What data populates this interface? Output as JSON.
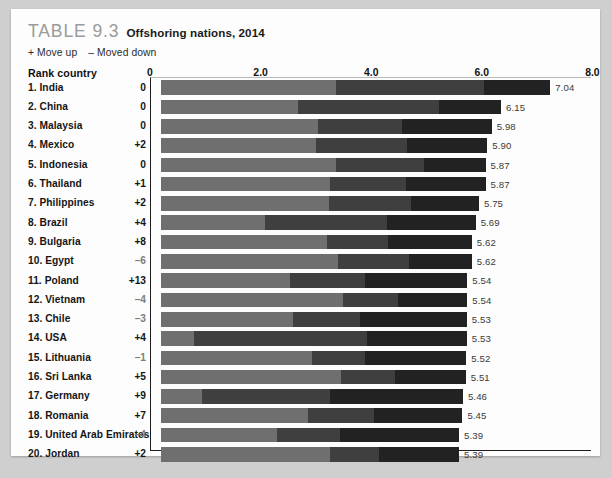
{
  "title": {
    "table_label": "TABLE 9.3",
    "caption": "Offshoring nations, 2014"
  },
  "legend": {
    "up": "+ Move up",
    "down": "– Moved down"
  },
  "headers": {
    "rank_country": "Rank country"
  },
  "colors": {
    "segment_1": "#6f6f6f",
    "segment_2": "#3f3f3f",
    "segment_3": "#222222",
    "card_background": "#fdfdfd",
    "page_background": "#cfcfcf",
    "table_label": "#9a9a9a",
    "move_down_text": "#7e7e7e"
  },
  "chart_data": {
    "type": "bar",
    "orientation": "horizontal",
    "stacked": true,
    "title": "Offshoring nations, 2014",
    "xlabel": "",
    "ylabel": "Rank country",
    "xlim": [
      0,
      8
    ],
    "xticks": [
      "0",
      "2.0",
      "4.0",
      "6.0",
      "8.0"
    ],
    "xtick_values": [
      0,
      2,
      4,
      6,
      8
    ],
    "grid": false,
    "legend_position": "none",
    "series": [
      {
        "name": "Financial attractiveness",
        "color": "#6f6f6f"
      },
      {
        "name": "People skills and availability",
        "color": "#3f3f3f"
      },
      {
        "name": "Business environment",
        "color": "#222222"
      }
    ],
    "categories": [
      "1. India",
      "2. China",
      "3. Malaysia",
      "4. Mexico",
      "5. Indonesia",
      "6. Thailand",
      "7. Philippines",
      "8. Brazil",
      "9. Bulgaria",
      "10. Egypt",
      "11. Poland",
      "12. Vietnam",
      "13. Chile",
      "14. USA",
      "15. Lithuania",
      "16. Sri Lanka",
      "17. Germany",
      "18. Romania",
      "19. United Arab Emirates",
      "20. Jordan"
    ],
    "rows": [
      {
        "rank": 1,
        "country": "1. India",
        "move": "0",
        "move_dir": "none",
        "total": "7.04",
        "total_value": 7.04,
        "segments": [
          3.16,
          2.68,
          1.2
        ]
      },
      {
        "rank": 2,
        "country": "2. China",
        "move": "0",
        "move_dir": "none",
        "total": "6.15",
        "total_value": 6.15,
        "segments": [
          2.48,
          2.55,
          1.12
        ]
      },
      {
        "rank": 3,
        "country": "3. Malaysia",
        "move": "0",
        "move_dir": "none",
        "total": "5.98",
        "total_value": 5.98,
        "segments": [
          2.84,
          1.52,
          1.62
        ]
      },
      {
        "rank": 4,
        "country": "4. Mexico",
        "move": "+2",
        "move_dir": "up",
        "total": "5.90",
        "total_value": 5.9,
        "segments": [
          2.8,
          1.65,
          1.45
        ]
      },
      {
        "rank": 5,
        "country": "5. Indonesia",
        "move": "0",
        "move_dir": "none",
        "total": "5.87",
        "total_value": 5.87,
        "segments": [
          3.16,
          1.6,
          1.11
        ]
      },
      {
        "rank": 6,
        "country": "6. Thailand",
        "move": "+1",
        "move_dir": "up",
        "total": "5.87",
        "total_value": 5.87,
        "segments": [
          3.05,
          1.38,
          1.44
        ]
      },
      {
        "rank": 7,
        "country": "7. Philippines",
        "move": "+2",
        "move_dir": "up",
        "total": "5.75",
        "total_value": 5.75,
        "segments": [
          3.04,
          1.48,
          1.23
        ]
      },
      {
        "rank": 8,
        "country": "8. Brazil",
        "move": "+4",
        "move_dir": "up",
        "total": "5.69",
        "total_value": 5.69,
        "segments": [
          1.88,
          2.2,
          1.61
        ]
      },
      {
        "rank": 9,
        "country": "9. Bulgaria",
        "move": "+8",
        "move_dir": "up",
        "total": "5.62",
        "total_value": 5.62,
        "segments": [
          3.0,
          1.1,
          1.52
        ]
      },
      {
        "rank": 10,
        "country": "10. Egypt",
        "move": "–6",
        "move_dir": "down",
        "total": "5.62",
        "total_value": 5.62,
        "segments": [
          3.2,
          1.28,
          1.14
        ]
      },
      {
        "rank": 11,
        "country": "11. Poland",
        "move": "+13",
        "move_dir": "up",
        "total": "5.54",
        "total_value": 5.54,
        "segments": [
          2.33,
          1.36,
          1.85
        ]
      },
      {
        "rank": 12,
        "country": "12. Vietnam",
        "move": "–4",
        "move_dir": "down",
        "total": "5.54",
        "total_value": 5.54,
        "segments": [
          3.29,
          1.0,
          1.25
        ]
      },
      {
        "rank": 13,
        "country": "13. Chile",
        "move": "–3",
        "move_dir": "down",
        "total": "5.53",
        "total_value": 5.53,
        "segments": [
          2.38,
          1.22,
          1.93
        ]
      },
      {
        "rank": 14,
        "country": "14. USA",
        "move": "+4",
        "move_dir": "up",
        "total": "5.53",
        "total_value": 5.53,
        "segments": [
          0.6,
          3.13,
          1.8
        ]
      },
      {
        "rank": 15,
        "country": "15. Lithuania",
        "move": "–1",
        "move_dir": "down",
        "total": "5.52",
        "total_value": 5.52,
        "segments": [
          2.73,
          0.95,
          1.84
        ]
      },
      {
        "rank": 16,
        "country": "16. Sri Lanka",
        "move": "+5",
        "move_dir": "up",
        "total": "5.51",
        "total_value": 5.51,
        "segments": [
          3.25,
          0.99,
          1.27
        ]
      },
      {
        "rank": 17,
        "country": "17. Germany",
        "move": "+9",
        "move_dir": "up",
        "total": "5.46",
        "total_value": 5.46,
        "segments": [
          0.75,
          2.3,
          2.41
        ]
      },
      {
        "rank": 18,
        "country": "18. Romania",
        "move": "+7",
        "move_dir": "up",
        "total": "5.45",
        "total_value": 5.45,
        "segments": [
          2.66,
          1.2,
          1.59
        ]
      },
      {
        "rank": 19,
        "country": "19. United Arab Emirates",
        "move": "–4",
        "move_dir": "down",
        "total": "5.39",
        "total_value": 5.39,
        "segments": [
          2.1,
          1.13,
          2.16
        ]
      },
      {
        "rank": 20,
        "country": "20. Jordan",
        "move": "+2",
        "move_dir": "up",
        "total": "5.39",
        "total_value": 5.39,
        "segments": [
          3.05,
          0.9,
          1.44
        ]
      }
    ]
  }
}
